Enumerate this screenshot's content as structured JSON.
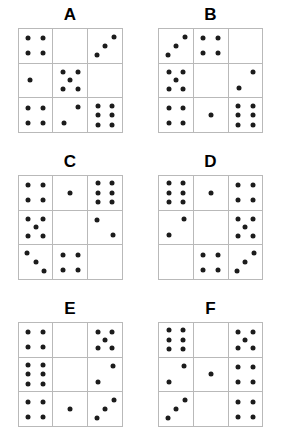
{
  "figure": {
    "type": "dot-pattern-matrix-puzzle",
    "panel_count": 6,
    "grid_rows": 3,
    "grid_cols": 3,
    "dot_color": "#1c1c1c",
    "grid_line_color": "#b9b9b9",
    "background_color": "#ffffff"
  },
  "patterns": {
    "empty": [],
    "one_center": [
      [
        50,
        50
      ]
    ],
    "one_left": [
      [
        32,
        50
      ]
    ],
    "four": [
      [
        28,
        28
      ],
      [
        72,
        28
      ],
      [
        28,
        72
      ],
      [
        72,
        72
      ]
    ],
    "five": [
      [
        28,
        26
      ],
      [
        72,
        26
      ],
      [
        50,
        50
      ],
      [
        28,
        74
      ],
      [
        72,
        74
      ]
    ],
    "six": [
      [
        28,
        22
      ],
      [
        72,
        22
      ],
      [
        28,
        50
      ],
      [
        72,
        50
      ],
      [
        28,
        78
      ],
      [
        72,
        78
      ]
    ],
    "diag3_up": [
      [
        26,
        76
      ],
      [
        50,
        50
      ],
      [
        76,
        24
      ]
    ],
    "diag3_down": [
      [
        24,
        24
      ],
      [
        50,
        50
      ],
      [
        76,
        76
      ]
    ],
    "diag2_tr_bl": [
      [
        30,
        72
      ],
      [
        74,
        26
      ]
    ],
    "diag2_tl_br": [
      [
        26,
        28
      ],
      [
        74,
        72
      ]
    ],
    "two_top_bottom": [
      [
        30,
        28
      ],
      [
        30,
        72
      ]
    ]
  },
  "panels": [
    {
      "label": "A",
      "cells": [
        "four",
        "empty",
        "diag3_up",
        "one_left",
        "five",
        "empty",
        "four",
        "diag2_tr_bl",
        "six"
      ]
    },
    {
      "label": "B",
      "cells": [
        "diag3_up",
        "four",
        "empty",
        "five",
        "empty",
        "diag2_tr_bl",
        "four",
        "one_center",
        "six"
      ]
    },
    {
      "label": "C",
      "cells": [
        "four",
        "one_center",
        "six",
        "five",
        "empty",
        "diag2_tl_br",
        "diag3_down",
        "four",
        "empty"
      ]
    },
    {
      "label": "D",
      "cells": [
        "six",
        "one_center",
        "four",
        "diag2_tr_bl",
        "empty",
        "five",
        "empty",
        "four",
        "diag3_up"
      ]
    },
    {
      "label": "E",
      "cells": [
        "four",
        "empty",
        "five",
        "six",
        "empty",
        "diag2_tr_bl",
        "four",
        "one_center",
        "diag3_up"
      ]
    },
    {
      "label": "F",
      "cells": [
        "six",
        "empty",
        "five",
        "diag2_tr_bl",
        "one_center",
        "four",
        "diag3_up",
        "empty",
        "four"
      ]
    }
  ]
}
